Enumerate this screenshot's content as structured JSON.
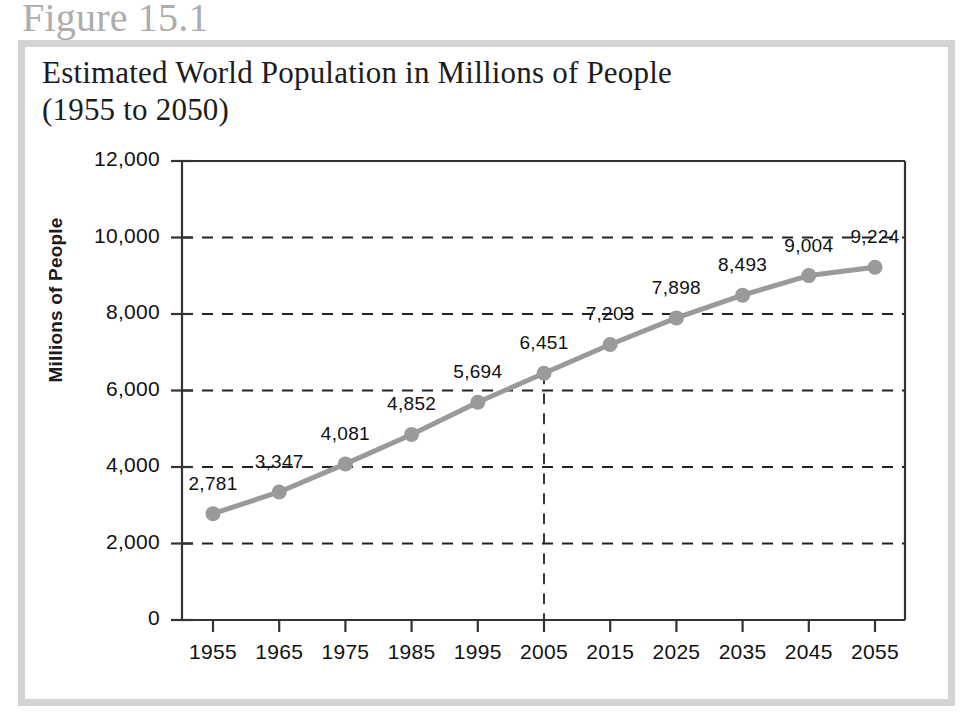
{
  "figure": {
    "number_label": "Figure 15.1",
    "title_line1": "Estimated World Population in Millions of People",
    "title_line2": "(1955 to 2050)"
  },
  "colors": {
    "frame": "#d4d4d4",
    "figure_number_text": "#adadad",
    "title_text": "#1c1c1c",
    "axis": "#333333",
    "gridline": "#222222",
    "series_line": "#9a9a9a",
    "marker": "#9a9a9a",
    "background": "#ffffff"
  },
  "chart_data": {
    "type": "line",
    "title": "Estimated World Population in Millions of People (1955 to 2050)",
    "xlabel": "",
    "ylabel": "Millions of People",
    "categories": [
      "1955",
      "1965",
      "1975",
      "1985",
      "1995",
      "2005",
      "2015",
      "2025",
      "2035",
      "2045",
      "2055"
    ],
    "values": [
      2781,
      3347,
      4081,
      4852,
      5694,
      6451,
      7203,
      7898,
      8493,
      9004,
      9224
    ],
    "point_labels": [
      "2,781",
      "3,347",
      "4,081",
      "4,852",
      "5,694",
      "6,451",
      "7,203",
      "7,898",
      "8,493",
      "9,004",
      "9,224"
    ],
    "ylim": [
      0,
      12000
    ],
    "ytick_values": [
      0,
      2000,
      4000,
      6000,
      8000,
      10000,
      12000
    ],
    "ytick_labels": [
      "0",
      "2,000",
      "4,000",
      "6,000",
      "8,000",
      "10,000",
      "12,000"
    ],
    "grid": "horizontal-dashed",
    "legend": "none",
    "annotations": [
      {
        "type": "vertical-dashed-line",
        "at_category": "2005",
        "from_value": 6451,
        "to_value": 0,
        "note": "marks present-day 2005 reference"
      }
    ]
  }
}
